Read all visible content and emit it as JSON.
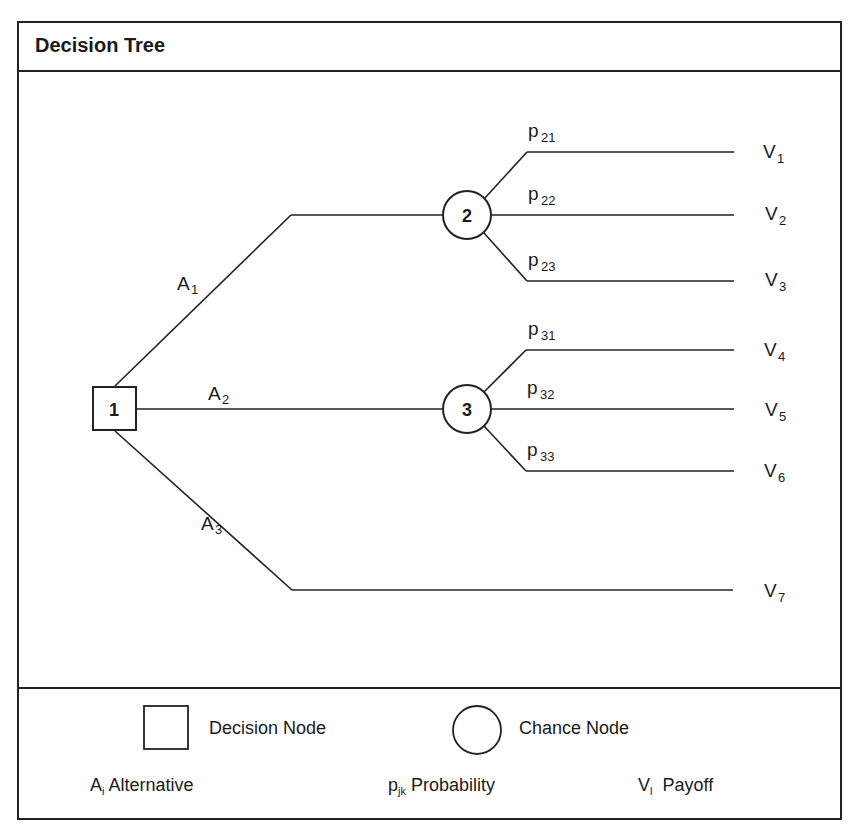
{
  "title": "Decision Tree",
  "nodes": {
    "decision": {
      "id": "1",
      "type": "decision"
    },
    "chance": [
      {
        "id": "2",
        "type": "chance"
      },
      {
        "id": "3",
        "type": "chance"
      }
    ]
  },
  "alternatives": [
    {
      "base": "A",
      "sub": "1"
    },
    {
      "base": "A",
      "sub": "2"
    },
    {
      "base": "A",
      "sub": "3"
    }
  ],
  "probabilities": [
    {
      "base": "p",
      "sub": "21"
    },
    {
      "base": "p",
      "sub": "22"
    },
    {
      "base": "p",
      "sub": "23"
    },
    {
      "base": "p",
      "sub": "31"
    },
    {
      "base": "p",
      "sub": "32"
    },
    {
      "base": "p",
      "sub": "33"
    }
  ],
  "payoffs": [
    {
      "base": "V",
      "sub": "1"
    },
    {
      "base": "V",
      "sub": "2"
    },
    {
      "base": "V",
      "sub": "3"
    },
    {
      "base": "V",
      "sub": "4"
    },
    {
      "base": "V",
      "sub": "5"
    },
    {
      "base": "V",
      "sub": "6"
    },
    {
      "base": "V",
      "sub": "7"
    }
  ],
  "legend": {
    "decision_node": "Decision Node",
    "chance_node": "Chance Node",
    "alternative": {
      "base": "A",
      "sub": "i",
      "label": "Alternative"
    },
    "probability": {
      "base": "p",
      "sub": "jk",
      "label": "Probability"
    },
    "payoff": {
      "base": "V",
      "sub": "l",
      "label": "Payoff"
    }
  },
  "colors": {
    "line": "#222222",
    "background": "#ffffff"
  }
}
